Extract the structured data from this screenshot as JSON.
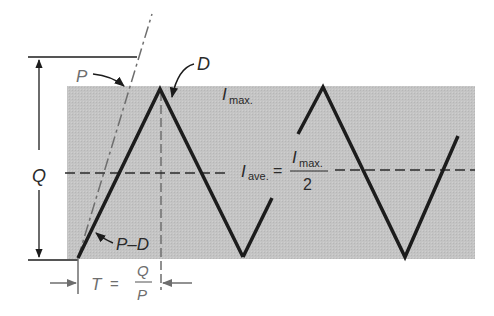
{
  "diagram": {
    "type": "inventory-sawtooth",
    "colors": {
      "background": "#ffffff",
      "region_fill": "#c2c2c2",
      "line": "#1c1c1c",
      "dashed_line": "#3a3a3a",
      "gray_text": "#6e6e6e"
    },
    "labels": {
      "P": "P",
      "D": "D",
      "Q": "Q",
      "P_minus_D": "P–D",
      "I_max_symbol": "I",
      "I_max_sub": "max.",
      "I_ave_symbol": "I",
      "I_ave_sub": "ave.",
      "equals": "=",
      "fraction_num_symbol": "I",
      "fraction_num_sub": "max.",
      "fraction_den": "2",
      "T": "T",
      "T_equals": "=",
      "T_num": "Q",
      "T_den": "P"
    }
  }
}
